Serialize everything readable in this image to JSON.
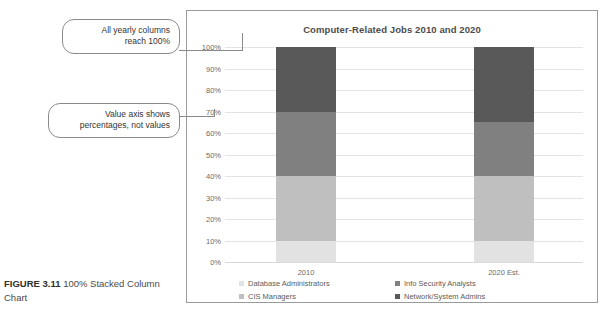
{
  "chart_data": {
    "type": "bar",
    "subtype": "100% stacked column",
    "title": "Computer-Related Jobs 2010 and 2020",
    "categories": [
      "2010",
      "2020 Est."
    ],
    "series": [
      {
        "name": "Database Administrators",
        "values": [
          10,
          10
        ],
        "color": "#e2e2e2"
      },
      {
        "name": "CIS Managers",
        "values": [
          30,
          30
        ],
        "color": "#bfbfbf"
      },
      {
        "name": "Info Security Analysts",
        "values": [
          30,
          25
        ],
        "color": "#808080"
      },
      {
        "name": "Network/System Admins",
        "values": [
          30,
          35
        ],
        "color": "#595959"
      }
    ],
    "stack_order_bottom_to_top": [
      "Database Administrators",
      "CIS Managers",
      "Info Security Analysts",
      "Network/System Admins"
    ],
    "ylabel": "",
    "xlabel": "",
    "ylim": [
      0,
      100
    ],
    "ytick_labels": [
      "0%",
      "10%",
      "20%",
      "30%",
      "40%",
      "50%",
      "60%",
      "70%",
      "80%",
      "90%",
      "100%"
    ],
    "ytick_values": [
      0,
      10,
      20,
      30,
      40,
      50,
      60,
      70,
      80,
      90,
      100
    ],
    "grid": true,
    "legend_position": "bottom"
  },
  "callouts": [
    {
      "id": "callout-1",
      "line1": "All yearly columns",
      "line2": "reach 100%"
    },
    {
      "id": "callout-2",
      "line1": "Value axis shows",
      "line2": "percentages, not values"
    }
  ],
  "caption": {
    "label": "FIGURE 3.11",
    "text": "100% Stacked Column Chart"
  }
}
